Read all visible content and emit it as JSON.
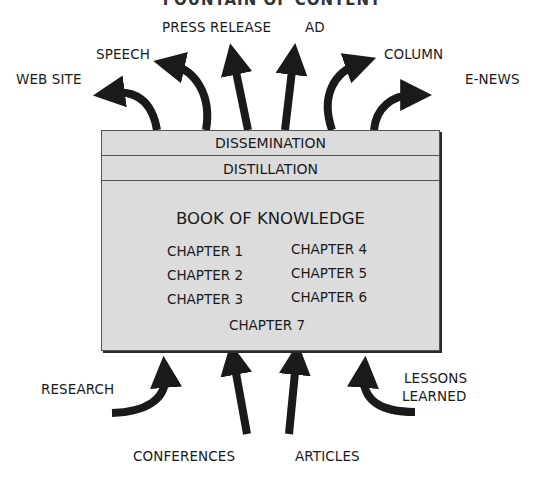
{
  "title": "FOUNTAIN OF CONTENT",
  "outputs": [
    {
      "label": "WEB SITE"
    },
    {
      "label": "SPEECH"
    },
    {
      "label": "PRESS RELEASE"
    },
    {
      "label": "AD"
    },
    {
      "label": "COLUMN"
    },
    {
      "label": "E-NEWS"
    }
  ],
  "box": {
    "layer1": "DISSEMINATION",
    "layer2": "DISTILLATION",
    "book_title": "BOOK OF KNOWLEDGE",
    "chapters": [
      "CHAPTER 1",
      "CHAPTER 2",
      "CHAPTER 3",
      "CHAPTER 4",
      "CHAPTER 5",
      "CHAPTER 6",
      "CHAPTER 7"
    ]
  },
  "inputs": [
    {
      "label": "RESEARCH"
    },
    {
      "label": "CONFERENCES"
    },
    {
      "label": "ARTICLES"
    },
    {
      "label_line1": "LESSONS",
      "label_line2": "LEARNED"
    }
  ],
  "colors": {
    "box_fill": "#dcdcdc",
    "arrow": "#1a1a1a",
    "border": "#555555"
  }
}
